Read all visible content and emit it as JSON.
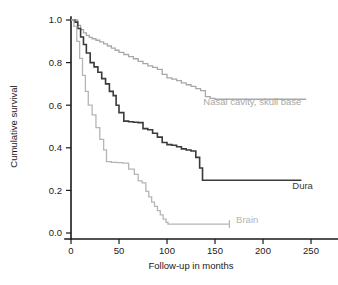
{
  "chart_data": {
    "type": "line",
    "title": "",
    "subtitle": "",
    "xlabel": "Follow-up in months",
    "ylabel": "Cumulative survival",
    "xlim": [
      0,
      260
    ],
    "ylim": [
      0.0,
      1.05
    ],
    "xticks": [
      0,
      50,
      100,
      150,
      200,
      250
    ],
    "xtick_labels": [
      "0",
      "50",
      "100",
      "150",
      "200",
      "250"
    ],
    "yticks": [
      0.0,
      0.2,
      0.4,
      0.6,
      0.8,
      1.0
    ],
    "ytick_labels": [
      "0.0",
      "0.2",
      "0.4",
      "0.6",
      "0.8",
      "1.0"
    ],
    "grid": false,
    "legend_position": "inline-at-curve-end",
    "series": [
      {
        "name": "Nasal cavity, skull base",
        "label": "Nasal cavity, skull base",
        "color": "#a8a8a8",
        "width": 1.3,
        "label_x": 240,
        "label_y": 0.6,
        "label_anchor": "end",
        "x": [
          0,
          4,
          7,
          10,
          13,
          16,
          19,
          22,
          26,
          30,
          34,
          38,
          42,
          46,
          50,
          55,
          60,
          65,
          70,
          75,
          80,
          85,
          90,
          95,
          100,
          105,
          110,
          115,
          120,
          125,
          130,
          135,
          140,
          145,
          150,
          245
        ],
        "y": [
          1.0,
          1.0,
          0.975,
          0.955,
          0.94,
          0.928,
          0.918,
          0.912,
          0.905,
          0.897,
          0.888,
          0.878,
          0.868,
          0.858,
          0.848,
          0.838,
          0.828,
          0.818,
          0.806,
          0.795,
          0.785,
          0.778,
          0.768,
          0.745,
          0.728,
          0.722,
          0.715,
          0.705,
          0.696,
          0.688,
          0.678,
          0.668,
          0.64,
          0.632,
          0.628,
          0.628
        ]
      },
      {
        "name": "Dura",
        "label": "Dura",
        "color": "#3a3a3a",
        "width": 1.6,
        "label_x": 252,
        "label_y": 0.205,
        "label_anchor": "end",
        "x": [
          0,
          4,
          7,
          10,
          13,
          16,
          20,
          24,
          28,
          32,
          36,
          40,
          44,
          47,
          50,
          55,
          60,
          65,
          70,
          75,
          80,
          85,
          90,
          95,
          100,
          105,
          110,
          115,
          120,
          125,
          130,
          134,
          137,
          240
        ],
        "y": [
          1.0,
          0.99,
          0.96,
          0.92,
          0.885,
          0.845,
          0.8,
          0.78,
          0.755,
          0.725,
          0.7,
          0.665,
          0.645,
          0.6,
          0.565,
          0.525,
          0.522,
          0.52,
          0.518,
          0.49,
          0.485,
          0.468,
          0.45,
          0.425,
          0.415,
          0.412,
          0.405,
          0.395,
          0.39,
          0.385,
          0.355,
          0.305,
          0.248,
          0.248
        ]
      },
      {
        "name": "Brain",
        "label": "Brain",
        "color": "#b5b5b5",
        "width": 1.3,
        "label_x": 172,
        "label_y": 0.045,
        "label_anchor": "start",
        "x": [
          0,
          3,
          6,
          9,
          12,
          15,
          18,
          22,
          26,
          30,
          34,
          37,
          42,
          48,
          54,
          60,
          66,
          70,
          74,
          78,
          81,
          84,
          87,
          90,
          93,
          96,
          99,
          101,
          165
        ],
        "y": [
          1.0,
          0.97,
          0.9,
          0.82,
          0.74,
          0.665,
          0.6,
          0.555,
          0.495,
          0.44,
          0.39,
          0.335,
          0.332,
          0.33,
          0.328,
          0.3,
          0.275,
          0.245,
          0.235,
          0.195,
          0.17,
          0.145,
          0.125,
          0.105,
          0.085,
          0.065,
          0.05,
          0.042,
          0.042
        ],
        "censor_marks": [
          {
            "x": 165,
            "y": 0.042
          }
        ]
      }
    ]
  }
}
